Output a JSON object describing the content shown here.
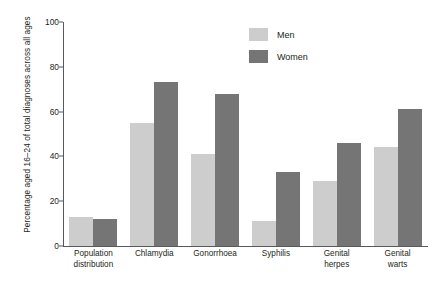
{
  "chart_data": {
    "type": "bar",
    "title": "",
    "xlabel": "",
    "ylabel": "Percentage aged 16–24 of total diagnoses across all ages",
    "ylim": [
      0,
      100
    ],
    "yticks": [
      "0",
      "20",
      "40",
      "60",
      "80",
      "100"
    ],
    "grid": false,
    "legend_position": "top-center-right",
    "categories": [
      "Population distribution",
      "Chlamydia",
      "Gonorrhoea",
      "Syphilis",
      "Genital herpes",
      "Genital warts"
    ],
    "series": [
      {
        "name": "Men",
        "color": "#cdcdcd",
        "values": [
          13,
          55,
          41,
          11,
          29,
          44
        ]
      },
      {
        "name": "Women",
        "color": "#757575",
        "values": [
          12,
          73,
          68,
          33,
          46,
          61
        ]
      }
    ]
  },
  "axis": {
    "ticks": [
      {
        "label": "100",
        "value": 100
      },
      {
        "label": "80",
        "value": 80
      },
      {
        "label": "60",
        "value": 60
      },
      {
        "label": "40",
        "value": 40
      },
      {
        "label": "20",
        "value": 20
      },
      {
        "label": "0",
        "value": 0
      }
    ]
  },
  "categories_lines": [
    [
      "Population",
      "distribution"
    ],
    [
      "Chlamydia",
      ""
    ],
    [
      "Gonorrhoea",
      ""
    ],
    [
      "Syphilis",
      ""
    ],
    [
      "Genital",
      "herpes"
    ],
    [
      "Genital",
      "warts"
    ]
  ],
  "legend": {
    "items": [
      {
        "label": "Men",
        "color": "#cdcdcd"
      },
      {
        "label": "Women",
        "color": "#757575"
      }
    ]
  }
}
